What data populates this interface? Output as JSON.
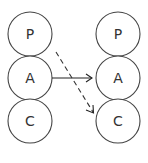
{
  "diagram": {
    "left_column": {
      "nodes": [
        {
          "id": "left-P",
          "label": "P"
        },
        {
          "id": "left-A",
          "label": "A"
        },
        {
          "id": "left-C",
          "label": "C"
        }
      ]
    },
    "right_column": {
      "nodes": [
        {
          "id": "right-P",
          "label": "P"
        },
        {
          "id": "right-A",
          "label": "A"
        },
        {
          "id": "right-C",
          "label": "C"
        }
      ]
    },
    "edges": [
      {
        "from": "left-A",
        "to": "right-A",
        "style": "solid"
      },
      {
        "from": "left-P",
        "to": "right-C",
        "style": "dashed"
      }
    ],
    "colors": {
      "stroke": "#444444",
      "text": "#333333",
      "background": "#ffffff"
    }
  }
}
